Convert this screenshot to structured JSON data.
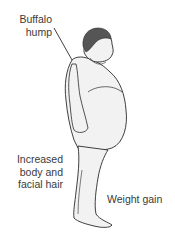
{
  "illustration": {
    "subject": "side-view line drawing of an obese standing man",
    "colors": {
      "background": "#ffffff",
      "outline": "#2a2a2a",
      "skin_fill": "#f2f2f2",
      "hair_fill": "#555555",
      "label_text": "#3a3a3a"
    }
  },
  "labels": {
    "buffalo_hump": {
      "lines": [
        "Buffalo",
        "hump"
      ]
    },
    "hair": {
      "lines": [
        "Increased",
        "body and",
        "facial hair"
      ]
    },
    "weight": {
      "lines": [
        "Weight gain"
      ]
    }
  }
}
